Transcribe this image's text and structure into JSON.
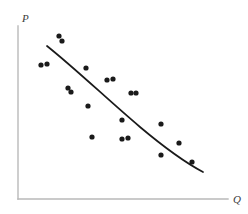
{
  "figure": {
    "title": "",
    "background_color": "#ffffff"
  },
  "chart_data": {
    "type": "scatter",
    "title": "",
    "subtitle": "",
    "xlabel": "Q",
    "ylabel": "P",
    "xlabel_text": "Q",
    "ylabel_text": "P",
    "grid": false,
    "legend": null,
    "legend_position": "none",
    "axis_style": {
      "color": "#b9b9b9",
      "width": 1.4,
      "x_axis_y": 199,
      "y_axis_x": 18,
      "x_axis_from": 18,
      "x_axis_to": 228,
      "y_axis_from": 199,
      "y_axis_to": 26
    },
    "xlim": [
      0,
      248
    ],
    "ylim": [
      0,
      214
    ],
    "marker": {
      "shape": "circle",
      "color": "#1a1a1a",
      "radius": 2.6
    },
    "points": [
      {
        "x": 59,
        "y": 36
      },
      {
        "x": 62,
        "y": 41
      },
      {
        "x": 41,
        "y": 65
      },
      {
        "x": 47,
        "y": 64
      },
      {
        "x": 86,
        "y": 68
      },
      {
        "x": 68,
        "y": 88
      },
      {
        "x": 71,
        "y": 92
      },
      {
        "x": 107,
        "y": 80
      },
      {
        "x": 113,
        "y": 79
      },
      {
        "x": 131,
        "y": 93
      },
      {
        "x": 136,
        "y": 93
      },
      {
        "x": 88,
        "y": 106
      },
      {
        "x": 122,
        "y": 120
      },
      {
        "x": 92,
        "y": 137
      },
      {
        "x": 122,
        "y": 139
      },
      {
        "x": 128,
        "y": 138
      },
      {
        "x": 161,
        "y": 124
      },
      {
        "x": 179,
        "y": 143
      },
      {
        "x": 161,
        "y": 155
      },
      {
        "x": 192,
        "y": 162
      }
    ],
    "fit_curve": {
      "name": "demand-curve",
      "color": "#1a1a1a",
      "width": 1.7,
      "path": "M 47 46 C 77 70, 108 100, 140 127 C 165 148, 186 163, 203 172"
    }
  }
}
